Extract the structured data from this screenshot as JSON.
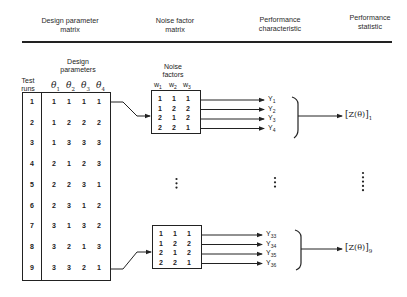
{
  "headers": {
    "design_matrix": "Design parameter\nmatrix",
    "design_matrix_l1": "Design parameter",
    "design_matrix_l2": "matrix",
    "noise_matrix_l1": "Noise factor",
    "noise_matrix_l2": "matrix",
    "perf_char_l1": "Performance",
    "perf_char_l2": "characteristic",
    "perf_stat_l1": "Performance",
    "perf_stat_l2": "statistic"
  },
  "design": {
    "title_l1": "Design",
    "title_l2": "parameters",
    "test_runs_l1": "Test",
    "test_runs_l2": "runs",
    "params": [
      "θ1",
      "θ2",
      "θ3",
      "θ4"
    ],
    "param_base": "θ",
    "param_subs": [
      "1",
      "2",
      "3",
      "4"
    ],
    "rows": [
      {
        "run": "1",
        "values": [
          "1",
          "1",
          "1",
          "1"
        ]
      },
      {
        "run": "2",
        "values": [
          "1",
          "2",
          "2",
          "2"
        ]
      },
      {
        "run": "3",
        "values": [
          "1",
          "3",
          "3",
          "3"
        ]
      },
      {
        "run": "4",
        "values": [
          "2",
          "1",
          "2",
          "3"
        ]
      },
      {
        "run": "5",
        "values": [
          "2",
          "2",
          "3",
          "1"
        ]
      },
      {
        "run": "6",
        "values": [
          "2",
          "3",
          "1",
          "2"
        ]
      },
      {
        "run": "7",
        "values": [
          "3",
          "1",
          "3",
          "2"
        ]
      },
      {
        "run": "8",
        "values": [
          "3",
          "2",
          "1",
          "3"
        ]
      },
      {
        "run": "9",
        "values": [
          "3",
          "3",
          "2",
          "1"
        ]
      }
    ]
  },
  "noise": {
    "title_l1": "Noise",
    "title_l2": "factors",
    "factor_base": "w",
    "factor_subs": [
      "1",
      "2",
      "3"
    ],
    "rows": [
      [
        "1",
        "1",
        "1"
      ],
      [
        "1",
        "2",
        "2"
      ],
      [
        "2",
        "1",
        "2"
      ],
      [
        "2",
        "2",
        "1"
      ]
    ]
  },
  "outputs_top": {
    "base": "Y",
    "subs": [
      "1",
      "2",
      "3",
      "4"
    ],
    "statistic": "[Z(θ)]",
    "statistic_inner": "Z(θ)",
    "statistic_sub": "1"
  },
  "outputs_bottom": {
    "base": "Y",
    "subs": [
      "33",
      "34",
      "35",
      "36"
    ],
    "statistic_inner": "Z(θ)",
    "statistic_sub": "9"
  },
  "ellipsis": {
    "noise_dots": 3,
    "perf_dots": 3,
    "stat_dots": 5
  }
}
